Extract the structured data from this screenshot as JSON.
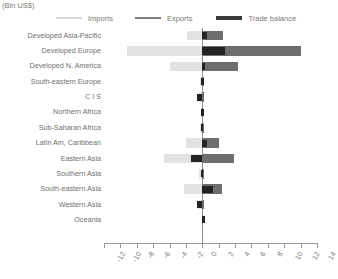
{
  "units_label": "(Bln US$)",
  "legend": {
    "position": "top",
    "items": [
      {
        "label": "Imports",
        "key": "imports",
        "color": "#e2e2e2",
        "swatch": "thin-line"
      },
      {
        "label": "Exports",
        "key": "exports",
        "color": "#6e6e6e",
        "swatch": "medium-line"
      },
      {
        "label": "Trade balance",
        "key": "trade_balance",
        "color": "#232323",
        "swatch": "thick-line"
      }
    ]
  },
  "chart_data": {
    "type": "bar",
    "orientation": "horizontal",
    "title": "",
    "subtitle": "",
    "xlabel": "(Bln US$)",
    "ylabel": "",
    "xlim": [
      -12,
      14
    ],
    "xticks": [
      -12,
      -10,
      -8,
      -6,
      -4,
      -2,
      0,
      2,
      4,
      6,
      8,
      10,
      12,
      14
    ],
    "xticklabels": [
      "-12",
      "-10",
      "-8",
      "-6",
      "-4",
      "-2",
      "0",
      "2",
      "4",
      "6",
      "8",
      "10",
      "12",
      "14"
    ],
    "grid": false,
    "tick_label_rotation": -60,
    "zero_reference_line": true,
    "categories": [
      "Developed Asia-Pacific",
      "Developed Europe",
      "Developed N. America",
      "South-eastern Europe",
      "C I S",
      "Northern Africa",
      "Sub-Saharan Africa",
      "Latin Am, Caribbean",
      "Eastern Asia",
      "Southern Asia",
      "South-eastern Asia",
      "Western Asia",
      "Oceania"
    ],
    "series": [
      {
        "name": "Imports",
        "color": "#e2e2e2",
        "values": [
          -1.9,
          -9.2,
          -4.0,
          -0.25,
          -0.4,
          -0.2,
          -0.3,
          -2.0,
          -4.7,
          -0.35,
          -2.2,
          -0.5,
          -0.05
        ]
      },
      {
        "name": "Exports",
        "color": "#6e6e6e",
        "values": [
          2.5,
          12.0,
          4.3,
          0.2,
          0.15,
          0.1,
          0.15,
          2.0,
          3.9,
          0.2,
          2.4,
          0.2,
          0.05
        ]
      },
      {
        "name": "Trade balance",
        "color": "#232323",
        "values": [
          0.6,
          2.8,
          0.3,
          -0.15,
          -0.6,
          -0.15,
          -0.2,
          0.6,
          -1.4,
          -0.2,
          1.3,
          -0.6,
          0.0
        ]
      }
    ]
  }
}
